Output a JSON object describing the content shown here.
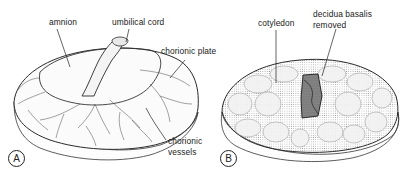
{
  "figure": {
    "panels": [
      {
        "id": "A",
        "letter": "A",
        "subject": "fetal surface of placenta",
        "labels": {
          "amnion": "amnion",
          "umbilical_cord": "umbilical cord",
          "chorionic_plate": "chorionic plate",
          "chorionic_vessels_1": "chorionic",
          "chorionic_vessels_2": "vessels"
        }
      },
      {
        "id": "B",
        "letter": "B",
        "subject": "maternal surface of placenta",
        "labels": {
          "cotyledon": "cotyledon",
          "decidua_1": "decidua basalis",
          "decidua_2": "removed"
        }
      }
    ],
    "colors": {
      "ink": "#1a1a1a",
      "stipple": "#9a9a9a",
      "background": "#ffffff"
    }
  }
}
